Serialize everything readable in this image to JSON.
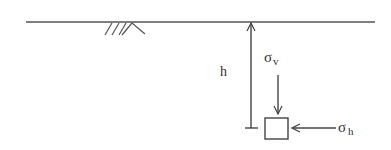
{
  "diagram": {
    "title": "",
    "ground_surface": {
      "label": ""
    },
    "depth_label": "h",
    "vertical_stress": {
      "symbol": "σ",
      "subscript": "v"
    },
    "horizontal_stress": {
      "symbol": "σ",
      "subscript": "h"
    },
    "element": {
      "label": ""
    },
    "colors": {
      "stroke": "#444444",
      "text": "#333333",
      "background": "#ffffff"
    }
  }
}
